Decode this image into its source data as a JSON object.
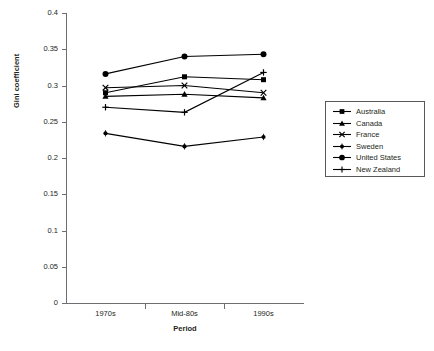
{
  "chart_data": {
    "type": "line",
    "title": "",
    "xlabel": "Period",
    "ylabel": "Gini coefficient",
    "categories": [
      "1970s",
      "Mid-80s",
      "1990s"
    ],
    "ylim": [
      0,
      0.4
    ],
    "yticks": [
      "0",
      "0.05",
      "0.1",
      "0.15",
      "0.2",
      "0.25",
      "0.3",
      "0.35",
      "0.4"
    ],
    "ytick_values": [
      0,
      0.05,
      0.1,
      0.15,
      0.2,
      0.25,
      0.3,
      0.35,
      0.4
    ],
    "grid": false,
    "legend_position": "right",
    "series": [
      {
        "name": "Australia",
        "marker": "square",
        "values": [
          0.29,
          0.312,
          0.308
        ]
      },
      {
        "name": "Canada",
        "marker": "triangle",
        "values": [
          0.285,
          0.288,
          0.283
        ]
      },
      {
        "name": "France",
        "marker": "cross",
        "values": [
          0.297,
          0.3,
          0.29
        ]
      },
      {
        "name": "Sweden",
        "marker": "dot",
        "values": [
          0.234,
          0.216,
          0.229
        ]
      },
      {
        "name": "United States",
        "marker": "circle",
        "values": [
          0.316,
          0.34,
          0.343
        ]
      },
      {
        "name": "New Zealand",
        "marker": "plus",
        "values": [
          0.27,
          0.263,
          0.318
        ]
      }
    ]
  },
  "legend": {
    "items": [
      {
        "label": "Australia"
      },
      {
        "label": "Canada"
      },
      {
        "label": "France"
      },
      {
        "label": "Sweden"
      },
      {
        "label": "United States"
      },
      {
        "label": "New Zealand"
      }
    ]
  },
  "axes": {
    "y_title": "Gini coefficient",
    "x_title": "Period"
  },
  "caption": ""
}
